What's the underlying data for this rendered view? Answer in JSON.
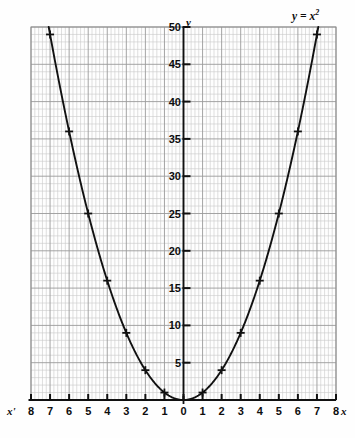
{
  "chart_data": {
    "type": "line",
    "title": "",
    "equation_label": "y = x²",
    "xlabel": "x",
    "ylabel": "y",
    "xlabel_left": "x'",
    "xlim": [
      -8,
      8
    ],
    "ylim": [
      0,
      50
    ],
    "grid": true,
    "grid_minor_x_per_unit": 5,
    "grid_minor_y_step": 1,
    "x_ticks": [
      -8,
      -7,
      -6,
      -5,
      -4,
      -3,
      -2,
      -1,
      0,
      1,
      2,
      3,
      4,
      5,
      6,
      7,
      8
    ],
    "x_tick_labels": [
      "8",
      "7",
      "6",
      "5",
      "4",
      "3",
      "2",
      "1",
      "0",
      "1",
      "2",
      "3",
      "4",
      "5",
      "6",
      "7",
      "8"
    ],
    "x_tick_negative": [
      true,
      true,
      true,
      true,
      true,
      true,
      true,
      true,
      false,
      false,
      false,
      false,
      false,
      false,
      false,
      false,
      false
    ],
    "y_ticks": [
      5,
      10,
      15,
      20,
      25,
      30,
      35,
      40,
      45,
      50
    ],
    "y_tick_labels": [
      "5",
      "10",
      "15",
      "20",
      "25",
      "30",
      "35",
      "40",
      "45",
      "50"
    ],
    "series": [
      {
        "name": "y = x²",
        "marker": "plus",
        "color": "#111111",
        "x": [
          -7,
          -6,
          -5,
          -4,
          -3,
          -2,
          -1,
          0,
          1,
          2,
          3,
          4,
          5,
          6,
          7
        ],
        "values": [
          49,
          36,
          25,
          16,
          9,
          4,
          1,
          0,
          1,
          4,
          9,
          16,
          25,
          36,
          49
        ]
      }
    ],
    "colors": {
      "curve": "#111111",
      "axis": "#111111",
      "grid_major": "#9a9a9a",
      "grid_minor": "#c9c9c9",
      "background": "#fefefe",
      "text": "#0d0d0d"
    }
  }
}
